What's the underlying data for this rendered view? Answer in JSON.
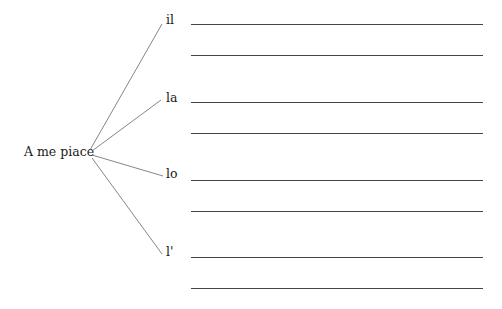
{
  "stem": "A me piace",
  "branches": [
    {
      "article": "il",
      "lines": 2
    },
    {
      "article": "la",
      "lines": 2
    },
    {
      "article": "lo",
      "lines": 2
    },
    {
      "article": "l'",
      "lines": 2
    }
  ],
  "colors": {
    "text": "#1a1a1a",
    "line": "#444444"
  }
}
